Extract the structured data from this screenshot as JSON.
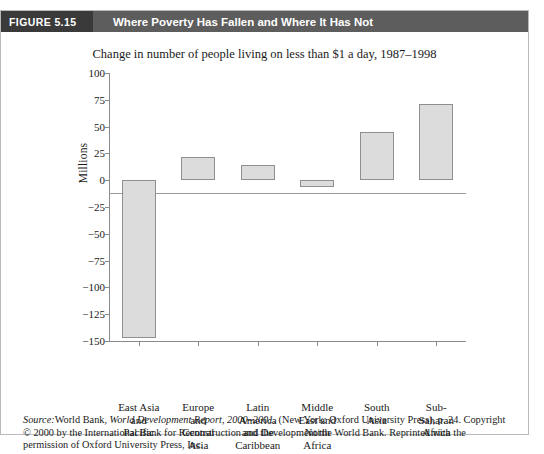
{
  "header": {
    "figure_number": "FIGURE 5.15",
    "title": "Where Poverty Has Fallen and Where It Has Not",
    "band_color": "#5d5d5d",
    "number_box_color": "#3a3a3a"
  },
  "source_note": {
    "source_word": "Source:",
    "publisher_text": "World Bank, ",
    "report_title": "World Development Report, 2000–2001",
    "rest": ". (New York: Oxford University Press), p. 24. Copyright © 2000 by the International Bank for Reconstruction and Development/the World Bank. Reprinted with the permission of Oxford University Press, Inc."
  },
  "chart_data": {
    "type": "bar",
    "title": "Change in number of people living on less than $1 a day, 1987–1998",
    "xlabel": "",
    "ylabel": "Millions",
    "ylim": [
      -150,
      100
    ],
    "yticks": [
      100,
      75,
      50,
      25,
      0,
      -25,
      -50,
      -75,
      -100,
      -125,
      -150
    ],
    "ytick_labels": [
      "100",
      "75",
      "50",
      "25",
      "0",
      "−25",
      "−50",
      "−75",
      "−100",
      "−125",
      "−150"
    ],
    "grid": false,
    "legend": "none",
    "bar_fill_color": "#dcdcdc",
    "bar_edge_color": "#8f8f8f",
    "categories": [
      "East Asia and Pacific",
      "Europe and Central Asia",
      "Latin America and the Caribbean",
      "Middle East and North Africa",
      "South Asia",
      "Sub-Saharan Africa"
    ],
    "category_lines": [
      [
        "East Asia",
        "and",
        "Pacific"
      ],
      [
        "Europe",
        "and",
        "Central",
        "Asia"
      ],
      [
        "Latin",
        "America",
        "and the",
        "Caribbean"
      ],
      [
        "Middle",
        "East and",
        "North",
        "Africa"
      ],
      [
        "South",
        "Asia"
      ],
      [
        "Sub-",
        "Saharan",
        "Africa"
      ]
    ],
    "values": [
      -147,
      22,
      14,
      -6,
      45,
      71
    ]
  }
}
